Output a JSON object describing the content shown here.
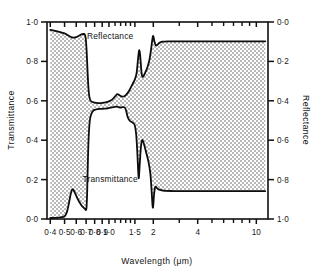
{
  "chart_data": {
    "type": "line",
    "title": "",
    "xlabel": "Wavelength (μm)",
    "ylabel": "Transmittance",
    "y2label": "Reflectance",
    "xscale": "log",
    "xlim": [
      0.38,
      12.0
    ],
    "ylim": [
      0.0,
      1.0
    ],
    "y2lim": [
      1.0,
      0.0
    ],
    "grid": false,
    "legend": "inline-annotations",
    "xticks": [
      {
        "value": 0.4,
        "label": "0·4"
      },
      {
        "value": 0.5,
        "label": "0·5"
      },
      {
        "value": 0.6,
        "label": "0·6"
      },
      {
        "value": 0.7,
        "label": "0·7"
      },
      {
        "value": 0.8,
        "label": "0·8"
      },
      {
        "value": 0.9,
        "label": "0·9"
      },
      {
        "value": 1.0,
        "label": "1·0"
      },
      {
        "value": 1.5,
        "label": "1·5"
      },
      {
        "value": 2.0,
        "label": "2"
      },
      {
        "value": 4.0,
        "label": "4"
      },
      {
        "value": 10.0,
        "label": "10"
      }
    ],
    "xticks_minor": [
      1.1,
      1.2,
      1.3,
      1.4,
      3.0,
      5.0,
      6.0,
      7.0,
      8.0,
      9.0
    ],
    "yticks_left": [
      {
        "value": 1.0,
        "label": "1·0"
      },
      {
        "value": 0.8,
        "label": "0·8"
      },
      {
        "value": 0.6,
        "label": "0·6"
      },
      {
        "value": 0.4,
        "label": "0·4"
      },
      {
        "value": 0.2,
        "label": "0·2"
      },
      {
        "value": 0.0,
        "label": "0·0"
      }
    ],
    "yticks_right": [
      {
        "value": 0.0,
        "label": "0·0"
      },
      {
        "value": 0.2,
        "label": "0·2"
      },
      {
        "value": 0.4,
        "label": "0·4"
      },
      {
        "value": 0.6,
        "label": "0·6"
      },
      {
        "value": 0.8,
        "label": "0·8"
      },
      {
        "value": 1.0,
        "label": "1·0"
      }
    ],
    "annotations": [
      {
        "text": "Reflectance",
        "x": 1.02,
        "y": 0.93
      },
      {
        "text": "Transmittance",
        "x": 1.02,
        "y": 0.205
      }
    ],
    "fill": {
      "between": [
        "reflectance",
        "transmittance"
      ],
      "pattern": "checkerboard-dither",
      "color": "#c8c8c8"
    },
    "series": [
      {
        "name": "Reflectance",
        "axis": "left-as-plotted",
        "points": [
          [
            0.4,
            0.96
          ],
          [
            0.43,
            0.955
          ],
          [
            0.46,
            0.95
          ],
          [
            0.48,
            0.946
          ],
          [
            0.5,
            0.942
          ],
          [
            0.52,
            0.935
          ],
          [
            0.54,
            0.928
          ],
          [
            0.56,
            0.922
          ],
          [
            0.58,
            0.921
          ],
          [
            0.6,
            0.923
          ],
          [
            0.62,
            0.928
          ],
          [
            0.64,
            0.934
          ],
          [
            0.66,
            0.938
          ],
          [
            0.675,
            0.939
          ],
          [
            0.685,
            0.937
          ],
          [
            0.695,
            0.92
          ],
          [
            0.705,
            0.86
          ],
          [
            0.715,
            0.76
          ],
          [
            0.725,
            0.672
          ],
          [
            0.735,
            0.625
          ],
          [
            0.75,
            0.601
          ],
          [
            0.78,
            0.593
          ],
          [
            0.82,
            0.589
          ],
          [
            0.86,
            0.588
          ],
          [
            0.9,
            0.589
          ],
          [
            0.95,
            0.592
          ],
          [
            1.0,
            0.597
          ],
          [
            1.05,
            0.606
          ],
          [
            1.1,
            0.622
          ],
          [
            1.14,
            0.634
          ],
          [
            1.18,
            0.628
          ],
          [
            1.22,
            0.622
          ],
          [
            1.27,
            0.623
          ],
          [
            1.32,
            0.634
          ],
          [
            1.38,
            0.655
          ],
          [
            1.44,
            0.682
          ],
          [
            1.5,
            0.709
          ],
          [
            1.54,
            0.74
          ],
          [
            1.57,
            0.8
          ],
          [
            1.595,
            0.848
          ],
          [
            1.61,
            0.856
          ],
          [
            1.625,
            0.838
          ],
          [
            1.645,
            0.79
          ],
          [
            1.665,
            0.742
          ],
          [
            1.69,
            0.722
          ],
          [
            1.72,
            0.727
          ],
          [
            1.76,
            0.742
          ],
          [
            1.82,
            0.768
          ],
          [
            1.88,
            0.806
          ],
          [
            1.93,
            0.86
          ],
          [
            1.965,
            0.906
          ],
          [
            1.99,
            0.928
          ],
          [
            2.01,
            0.922
          ],
          [
            2.04,
            0.898
          ],
          [
            2.08,
            0.881
          ],
          [
            2.13,
            0.884
          ],
          [
            2.2,
            0.894
          ],
          [
            2.3,
            0.9
          ],
          [
            2.5,
            0.902
          ],
          [
            3.0,
            0.902
          ],
          [
            4.0,
            0.902
          ],
          [
            6.0,
            0.902
          ],
          [
            8.0,
            0.902
          ],
          [
            10.0,
            0.902
          ],
          [
            11.5,
            0.902
          ]
        ]
      },
      {
        "name": "Transmittance",
        "axis": "left",
        "points": [
          [
            0.4,
            0.005
          ],
          [
            0.44,
            0.006
          ],
          [
            0.47,
            0.008
          ],
          [
            0.49,
            0.011
          ],
          [
            0.5,
            0.014
          ],
          [
            0.51,
            0.022
          ],
          [
            0.52,
            0.038
          ],
          [
            0.53,
            0.064
          ],
          [
            0.54,
            0.095
          ],
          [
            0.55,
            0.125
          ],
          [
            0.56,
            0.146
          ],
          [
            0.565,
            0.152
          ],
          [
            0.575,
            0.147
          ],
          [
            0.59,
            0.13
          ],
          [
            0.61,
            0.106
          ],
          [
            0.63,
            0.086
          ],
          [
            0.65,
            0.07
          ],
          [
            0.67,
            0.059
          ],
          [
            0.69,
            0.05
          ],
          [
            0.7,
            0.046
          ],
          [
            0.705,
            0.06
          ],
          [
            0.712,
            0.14
          ],
          [
            0.718,
            0.26
          ],
          [
            0.725,
            0.375
          ],
          [
            0.733,
            0.452
          ],
          [
            0.742,
            0.5
          ],
          [
            0.755,
            0.528
          ],
          [
            0.775,
            0.546
          ],
          [
            0.8,
            0.554
          ],
          [
            0.84,
            0.558
          ],
          [
            0.88,
            0.559
          ],
          [
            0.93,
            0.56
          ],
          [
            0.98,
            0.562
          ],
          [
            1.03,
            0.565
          ],
          [
            1.08,
            0.568
          ],
          [
            1.12,
            0.57
          ],
          [
            1.16,
            0.568
          ],
          [
            1.2,
            0.566
          ],
          [
            1.24,
            0.568
          ],
          [
            1.28,
            0.566
          ],
          [
            1.31,
            0.548
          ],
          [
            1.34,
            0.518
          ],
          [
            1.38,
            0.5
          ],
          [
            1.42,
            0.493
          ],
          [
            1.46,
            0.487
          ],
          [
            1.5,
            0.474
          ],
          [
            1.53,
            0.43
          ],
          [
            1.555,
            0.35
          ],
          [
            1.575,
            0.262
          ],
          [
            1.59,
            0.21
          ],
          [
            1.6,
            0.218
          ],
          [
            1.615,
            0.268
          ],
          [
            1.64,
            0.346
          ],
          [
            1.665,
            0.392
          ],
          [
            1.685,
            0.401
          ],
          [
            1.71,
            0.392
          ],
          [
            1.75,
            0.366
          ],
          [
            1.8,
            0.33
          ],
          [
            1.86,
            0.286
          ],
          [
            1.91,
            0.23
          ],
          [
            1.945,
            0.15
          ],
          [
            1.97,
            0.082
          ],
          [
            1.985,
            0.058
          ],
          [
            2.0,
            0.072
          ],
          [
            2.02,
            0.118
          ],
          [
            2.045,
            0.152
          ],
          [
            2.07,
            0.164
          ],
          [
            2.1,
            0.16
          ],
          [
            2.15,
            0.152
          ],
          [
            2.25,
            0.146
          ],
          [
            2.4,
            0.143
          ],
          [
            2.7,
            0.142
          ],
          [
            3.2,
            0.142
          ],
          [
            4.0,
            0.142
          ],
          [
            6.0,
            0.142
          ],
          [
            8.0,
            0.142
          ],
          [
            10.0,
            0.142
          ],
          [
            11.5,
            0.142
          ]
        ]
      }
    ]
  },
  "labels": {
    "x_axis_title": "Wavelength (μm)",
    "y_left_title": "Transmittance",
    "y_right_title": "Reflectance",
    "curve_upper": "Reflectance",
    "curve_lower": "Transmittance"
  },
  "colors": {
    "background": "#ffffff",
    "ink": "#111111",
    "fill": "#c8c8c8"
  }
}
